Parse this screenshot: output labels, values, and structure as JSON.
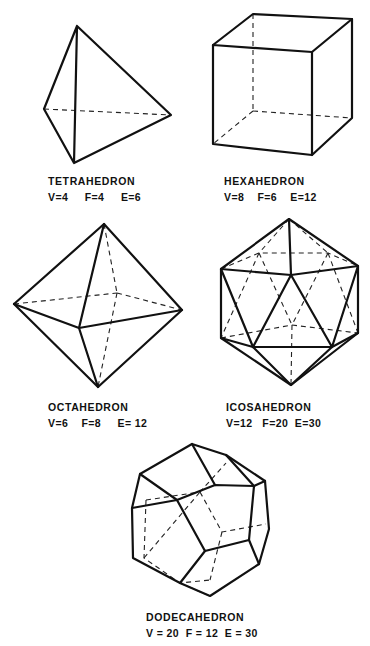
{
  "figure": {
    "solids": [
      {
        "name": "TETRAHEDRON",
        "stats": {
          "V": 4,
          "F": 4,
          "E": 6
        },
        "stats_text": "V=4     F=4     E=6"
      },
      {
        "name": "HEXAHEDRON",
        "stats": {
          "V": 8,
          "F": 6,
          "E": 12
        },
        "stats_text": "V=8    F=6    E=12"
      },
      {
        "name": "OCTAHEDRON",
        "stats": {
          "V": 6,
          "F": 8,
          "E": 12
        },
        "stats_text": "V=6    F=8     E= 12"
      },
      {
        "name": "ICOSAHEDRON",
        "stats": {
          "V": 12,
          "F": 20,
          "E": 30
        },
        "stats_text": "V=12   F=20  E=30"
      },
      {
        "name": "DODECAHEDRON",
        "stats": {
          "V": 20,
          "F": 12,
          "E": 30
        },
        "stats_text": "V = 20  F = 12  E = 30"
      }
    ]
  }
}
